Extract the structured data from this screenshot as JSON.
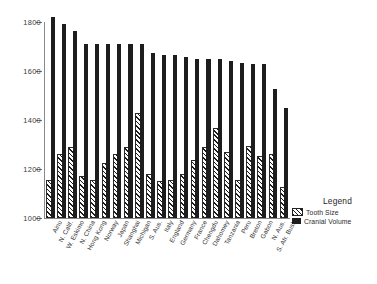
{
  "chart_data": {
    "type": "bar",
    "title": "",
    "xlabel": "",
    "ylabel": "",
    "ylim": [
      1000,
      1800
    ],
    "yticks": [
      1000,
      1200,
      1400,
      1600,
      1800
    ],
    "ytick_labels": [
      "1000",
      "1200",
      "1400",
      "1600",
      "1800"
    ],
    "grid": false,
    "legend": {
      "title": "Legend",
      "position": "right-bottom",
      "entries": [
        {
          "name": "Tooth Size",
          "pattern": "hatched",
          "color": "#1d1d1d"
        },
        {
          "name": "Cranial Volume",
          "pattern": "solid",
          "color": "#1d1d1d"
        }
      ]
    },
    "categories": [
      "Ainu",
      "N. Calif.",
      "W. Eskimo",
      "N. China",
      "Hong Kong",
      "Norway",
      "Japan",
      "Shanghai",
      "Michigan",
      "S. Aus.",
      "Italy",
      "England",
      "Germany",
      "France",
      "Chengdu",
      "Dahomey",
      "Tanzania",
      "Peru",
      "Breton",
      "Gabon",
      "N. Aus.",
      "S. Afr. Bush"
    ],
    "series": [
      {
        "name": "Tooth Size",
        "pattern": "hatched",
        "values": [
          1148,
          1252,
          1282,
          1162,
          1148,
          1218,
          1252,
          1282,
          1420,
          1172,
          1144,
          1148,
          1172,
          1230,
          1282,
          1358,
          1260,
          1148,
          1285,
          1245,
          1252,
          1120
        ]
      },
      {
        "name": "Cranial Volume",
        "pattern": "solid",
        "values": [
          1820,
          1790,
          1762,
          1712,
          1712,
          1712,
          1712,
          1712,
          1712,
          1675,
          1665,
          1665,
          1658,
          1650,
          1648,
          1648,
          1640,
          1632,
          1630,
          1628,
          1528,
          1448
        ]
      }
    ]
  }
}
